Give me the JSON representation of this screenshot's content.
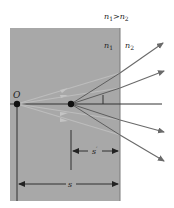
{
  "diagram": {
    "condition": {
      "n1": "n",
      "sub1": "1",
      "gt": ">",
      "n2": "n",
      "sub2": "2"
    },
    "media": {
      "medium1": {
        "label": "n",
        "sub": "1",
        "color": "#a8a8a8"
      },
      "medium2": {
        "label": "n",
        "sub": "2",
        "color": "#ffffff"
      }
    },
    "points": {
      "object": {
        "label": "O"
      },
      "image": {
        "label": "I"
      }
    },
    "dimensions": {
      "image_distance": {
        "label": "s",
        "prime": "′"
      },
      "object_distance": {
        "label": "s"
      }
    },
    "colors": {
      "ray": "#6a6a6a",
      "ray_faint": "#b9b9b9",
      "axis": "#333333",
      "point": "#111111"
    }
  }
}
